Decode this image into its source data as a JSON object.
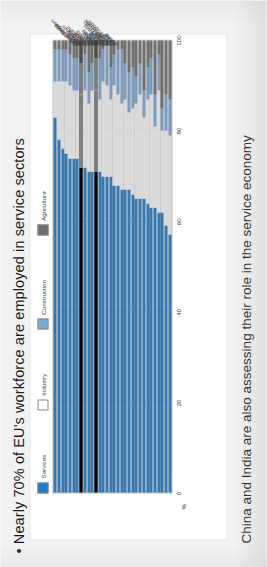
{
  "slide": {
    "title": "• Nearly 70% of EU's workforce are employed in service sectors",
    "footer": "China and India are also assessing their role in the service economy"
  },
  "chart_data": {
    "type": "bar",
    "orientation": "horizontal-stacked",
    "title": "",
    "subtitle": "",
    "xlabel": "%",
    "ylabel": "",
    "axis_unit": "%",
    "xlim": [
      0,
      100
    ],
    "xticks": [
      0,
      20,
      40,
      60,
      80,
      100
    ],
    "xtick_labels": [
      "0",
      "20",
      "40",
      "60",
      "80",
      "100"
    ],
    "grid": true,
    "legend_position": "top",
    "stack_order": [
      "Services",
      "Industry",
      "Construction",
      "Agriculture"
    ],
    "colors": {
      "Services": "#1f79c4",
      "Industry": "#ffffff",
      "Construction": "#7fa9d8",
      "Agriculture": "#6d6d6d",
      "highlight": "#0a0a0a"
    },
    "legend": [
      {
        "label": "Services",
        "color": "#1f79c4"
      },
      {
        "label": "Industry",
        "color": "#ffffff"
      },
      {
        "label": "Construction",
        "color": "#7fa9d8"
      },
      {
        "label": "Agriculture",
        "color": "#6d6d6d"
      }
    ],
    "categories": [
      "Luxembourg",
      "United States",
      "United Kingdom",
      "Belgium",
      "France",
      "Netherlands",
      "Denmark",
      "OECD",
      "Switzerland",
      "Greece",
      "Sweden",
      "EU19",
      "Australia",
      "Italy",
      "Japan",
      "Mexico",
      "Germany",
      "Portugal",
      "Spain",
      "Austria",
      "Iceland",
      "Luxembourg (2)",
      "Poland",
      "Hungary",
      "Canada (2001)",
      "Finland",
      "Slovak Republic",
      "Norway",
      "Czech Republic",
      "Turkey",
      "Korea",
      "Ireland"
    ],
    "series": [
      {
        "name": "Services",
        "color": "#1f79c4",
        "values": [
          83,
          78,
          76,
          75,
          74,
          74,
          74,
          72,
          72,
          71,
          71,
          71,
          71,
          70,
          70,
          70,
          68,
          68,
          67,
          67,
          67,
          66,
          65,
          65,
          65,
          64,
          63,
          63,
          62,
          62,
          59,
          57
        ]
      },
      {
        "name": "Industry",
        "color": "#ffffff",
        "values": [
          8,
          13,
          15,
          16,
          16,
          15,
          15,
          16,
          17,
          15,
          18,
          18,
          16,
          21,
          20,
          17,
          22,
          20,
          19,
          20,
          17,
          19,
          21,
          23,
          18,
          23,
          25,
          18,
          27,
          18,
          21,
          22
        ]
      },
      {
        "name": "Construction",
        "color": "#7fa9d8",
        "values": [
          7,
          7,
          7,
          7,
          7,
          7,
          7,
          7,
          8,
          7,
          6,
          7,
          9,
          7,
          9,
          7,
          7,
          10,
          12,
          8,
          9,
          9,
          6,
          7,
          6,
          7,
          8,
          7,
          8,
          5,
          8,
          8
        ]
      },
      {
        "name": "Agriculture",
        "color": "#6d6d6d",
        "values": [
          2,
          2,
          2,
          2,
          3,
          4,
          4,
          5,
          3,
          7,
          5,
          4,
          4,
          2,
          1,
          6,
          3,
          2,
          2,
          5,
          7,
          6,
          8,
          5,
          11,
          6,
          4,
          12,
          3,
          15,
          12,
          13
        ]
      }
    ],
    "highlighted_categories": [
      "OECD",
      "EU19"
    ],
    "annotations": []
  }
}
